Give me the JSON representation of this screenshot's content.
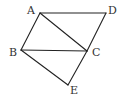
{
  "diagram": {
    "type": "geometry",
    "stroke_color": "#222222",
    "points": {
      "A": {
        "label": "A",
        "x": 40,
        "y": 13
      },
      "D": {
        "label": "D",
        "x": 106,
        "y": 13
      },
      "B": {
        "label": "B",
        "x": 21,
        "y": 50
      },
      "C": {
        "label": "C",
        "x": 87,
        "y": 51
      },
      "E": {
        "label": "E",
        "x": 68,
        "y": 85
      }
    },
    "segments": [
      "AD",
      "AB",
      "AC",
      "BC",
      "DC",
      "CE",
      "BE"
    ]
  }
}
